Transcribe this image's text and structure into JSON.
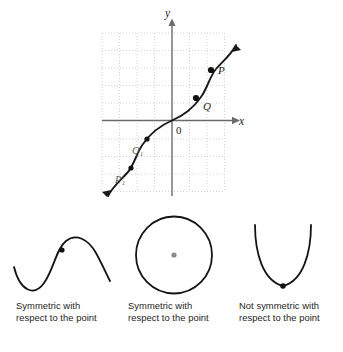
{
  "graph": {
    "axis_labels": {
      "x": "x",
      "y": "y"
    },
    "origin_label": "0",
    "points": [
      {
        "name": "P",
        "label": "P",
        "x": 211,
        "y": 70,
        "label_x": 218,
        "label_y": 72
      },
      {
        "name": "Q",
        "label": "Q",
        "x": 196,
        "y": 98,
        "label_x": 203,
        "label_y": 108
      },
      {
        "name": "Q1",
        "label": "Q₁",
        "x": 147,
        "y": 139,
        "label_x": 131,
        "label_y": 152
      },
      {
        "name": "P1",
        "label": "P₁",
        "x": 131,
        "y": 168,
        "label_x": 114,
        "label_y": 181
      }
    ],
    "curve_type": "odd-symmetric-cubic",
    "grid": {
      "spacing": 17.5,
      "style": "dotted",
      "color": "#c9c9c9"
    },
    "axis_color": "#6b6b6b",
    "curve_color": "#1a1a1a"
  },
  "figures": [
    {
      "name": "sine-curve",
      "shape": "sine",
      "point_label": "center-point",
      "caption_line1": "Symmetric with",
      "caption_line2": "respect to the point"
    },
    {
      "name": "circle",
      "shape": "circle",
      "point_label": "center-point",
      "caption_line1": "Symmetric with",
      "caption_line2": "respect to the point"
    },
    {
      "name": "parabola",
      "shape": "parabola",
      "point_label": "vertex-point",
      "caption_line1": "Not symmetric with",
      "caption_line2": "respect to the point"
    }
  ],
  "colors": {
    "stroke": "#1a1a1a",
    "grid": "#c9c9c9",
    "axis": "#6b6b6b",
    "point_fill": "#111111",
    "circle_center_fill": "#8a8a8a",
    "text": "#1d1d1d"
  }
}
